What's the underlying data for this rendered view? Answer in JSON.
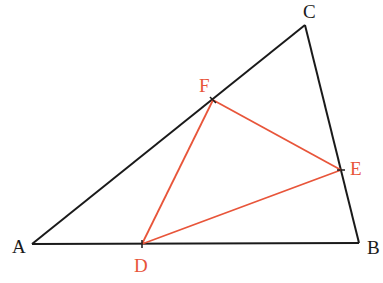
{
  "diagram": {
    "colors": {
      "outer": "#1a1a1a",
      "inner": "#e8553a",
      "background": "#ffffff"
    },
    "points": {
      "A": {
        "label": "A",
        "x": 32,
        "y": 244
      },
      "B": {
        "label": "B",
        "x": 359,
        "y": 243
      },
      "C": {
        "label": "C",
        "x": 305,
        "y": 25
      },
      "D": {
        "label": "D",
        "x": 142,
        "y": 244
      },
      "E": {
        "label": "E",
        "x": 341,
        "y": 170
      },
      "F": {
        "label": "F",
        "x": 213,
        "y": 100
      }
    },
    "outer_triangle": [
      "A",
      "B",
      "C"
    ],
    "inner_triangle": [
      "D",
      "E",
      "F"
    ],
    "labels": {
      "A": "A",
      "B": "B",
      "C": "C",
      "D": "D",
      "E": "E",
      "F": "F"
    }
  }
}
